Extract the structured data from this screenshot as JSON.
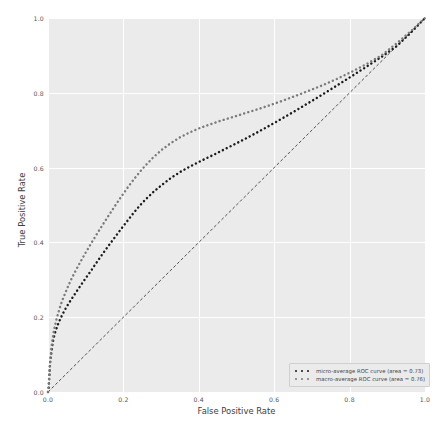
{
  "chart_data": {
    "type": "line",
    "title": "",
    "xlabel": "False Positive Rate",
    "ylabel": "True Positive Rate",
    "xlim": [
      0.0,
      1.0
    ],
    "ylim": [
      0.0,
      1.0
    ],
    "xticks": [
      "0.0",
      "0.2",
      "0.4",
      "0.6",
      "0.8",
      "1.0"
    ],
    "xtick_values": [
      0.0,
      0.2,
      0.4,
      0.6,
      0.8,
      1.0
    ],
    "yticks": [
      "0.0",
      "0.2",
      "0.4",
      "0.6",
      "0.8",
      "1.0"
    ],
    "ytick_values": [
      0.0,
      0.2,
      0.4,
      0.6,
      0.8,
      1.0
    ],
    "grid": true,
    "grid_color": "#ffffff",
    "plot_background": "#ebebeb",
    "figure_background": "#ffffff",
    "legend_position": "lower right",
    "series": [
      {
        "name": "micro-average ROC curve (area = 0.73)",
        "label": "micro-average ROC curve (area = 0.73)",
        "area": 0.73,
        "color": "#1a1a1a",
        "linestyle": "dotted",
        "points": [
          [
            0.0,
            0.0
          ],
          [
            0.002,
            0.012
          ],
          [
            0.003,
            0.03
          ],
          [
            0.004,
            0.048
          ],
          [
            0.005,
            0.066
          ],
          [
            0.006,
            0.082
          ],
          [
            0.008,
            0.098
          ],
          [
            0.01,
            0.113
          ],
          [
            0.012,
            0.127
          ],
          [
            0.014,
            0.14
          ],
          [
            0.017,
            0.152
          ],
          [
            0.02,
            0.163
          ],
          [
            0.024,
            0.174
          ],
          [
            0.028,
            0.185
          ],
          [
            0.033,
            0.196
          ],
          [
            0.038,
            0.207
          ],
          [
            0.044,
            0.218
          ],
          [
            0.05,
            0.229
          ],
          [
            0.057,
            0.24
          ],
          [
            0.064,
            0.251
          ],
          [
            0.072,
            0.263
          ],
          [
            0.08,
            0.275
          ],
          [
            0.088,
            0.287
          ],
          [
            0.097,
            0.3
          ],
          [
            0.106,
            0.313
          ],
          [
            0.116,
            0.327
          ],
          [
            0.126,
            0.342
          ],
          [
            0.137,
            0.358
          ],
          [
            0.149,
            0.375
          ],
          [
            0.162,
            0.393
          ],
          [
            0.176,
            0.412
          ],
          [
            0.191,
            0.432
          ],
          [
            0.207,
            0.453
          ],
          [
            0.224,
            0.475
          ],
          [
            0.242,
            0.497
          ],
          [
            0.262,
            0.518
          ],
          [
            0.283,
            0.538
          ],
          [
            0.305,
            0.556
          ],
          [
            0.327,
            0.573
          ],
          [
            0.35,
            0.588
          ],
          [
            0.373,
            0.601
          ],
          [
            0.396,
            0.613
          ],
          [
            0.42,
            0.625
          ],
          [
            0.445,
            0.637
          ],
          [
            0.47,
            0.65
          ],
          [
            0.496,
            0.663
          ],
          [
            0.523,
            0.677
          ],
          [
            0.551,
            0.692
          ],
          [
            0.58,
            0.708
          ],
          [
            0.61,
            0.725
          ],
          [
            0.641,
            0.743
          ],
          [
            0.673,
            0.762
          ],
          [
            0.706,
            0.782
          ],
          [
            0.74,
            0.803
          ],
          [
            0.775,
            0.825
          ],
          [
            0.811,
            0.848
          ],
          [
            0.848,
            0.872
          ],
          [
            0.886,
            0.897
          ],
          [
            0.925,
            0.925
          ],
          [
            0.962,
            0.96
          ],
          [
            1.0,
            1.0
          ]
        ]
      },
      {
        "name": "macro-average ROC curve (area = 0.76)",
        "label": "macro-average ROC curve (area = 0.76)",
        "area": 0.76,
        "color": "#7a7a7a",
        "linestyle": "dotted",
        "points": [
          [
            0.0,
            0.0
          ],
          [
            0.002,
            0.02
          ],
          [
            0.003,
            0.045
          ],
          [
            0.005,
            0.07
          ],
          [
            0.007,
            0.095
          ],
          [
            0.009,
            0.118
          ],
          [
            0.012,
            0.14
          ],
          [
            0.015,
            0.16
          ],
          [
            0.019,
            0.179
          ],
          [
            0.023,
            0.197
          ],
          [
            0.028,
            0.214
          ],
          [
            0.033,
            0.231
          ],
          [
            0.039,
            0.248
          ],
          [
            0.046,
            0.265
          ],
          [
            0.053,
            0.282
          ],
          [
            0.061,
            0.3
          ],
          [
            0.07,
            0.318
          ],
          [
            0.08,
            0.337
          ],
          [
            0.091,
            0.357
          ],
          [
            0.103,
            0.378
          ],
          [
            0.116,
            0.4
          ],
          [
            0.13,
            0.423
          ],
          [
            0.145,
            0.447
          ],
          [
            0.161,
            0.472
          ],
          [
            0.178,
            0.498
          ],
          [
            0.196,
            0.525
          ],
          [
            0.215,
            0.552
          ],
          [
            0.235,
            0.578
          ],
          [
            0.256,
            0.603
          ],
          [
            0.278,
            0.626
          ],
          [
            0.301,
            0.647
          ],
          [
            0.325,
            0.665
          ],
          [
            0.35,
            0.681
          ],
          [
            0.376,
            0.694
          ],
          [
            0.403,
            0.706
          ],
          [
            0.431,
            0.716
          ],
          [
            0.46,
            0.726
          ],
          [
            0.49,
            0.735
          ],
          [
            0.521,
            0.745
          ],
          [
            0.553,
            0.755
          ],
          [
            0.586,
            0.766
          ],
          [
            0.62,
            0.778
          ],
          [
            0.655,
            0.791
          ],
          [
            0.691,
            0.805
          ],
          [
            0.728,
            0.82
          ],
          [
            0.766,
            0.837
          ],
          [
            0.805,
            0.856
          ],
          [
            0.845,
            0.877
          ],
          [
            0.886,
            0.901
          ],
          [
            0.928,
            0.935
          ],
          [
            0.965,
            0.967
          ],
          [
            1.0,
            1.0
          ]
        ]
      }
    ],
    "reference_line": {
      "name": "chance-diagonal",
      "from": [
        0.0,
        0.0
      ],
      "to": [
        1.0,
        1.0
      ],
      "color": "#3c3c3c",
      "linestyle": "dashed"
    }
  },
  "legend": {
    "items": [
      {
        "label": "micro-average ROC curve (area = 0.73)",
        "color": "#1a1a1a"
      },
      {
        "label": "macro-average ROC curve (area = 0.76)",
        "color": "#7a7a7a"
      }
    ]
  }
}
